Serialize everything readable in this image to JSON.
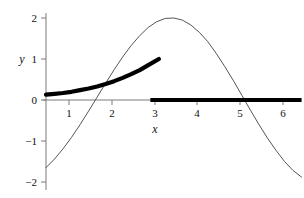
{
  "chart_data": {
    "type": "line",
    "title": "",
    "subtitle": "",
    "xlabel": "x",
    "ylabel": "y",
    "xlim": [
      0,
      6.1
    ],
    "ylim": [
      -2.1,
      2.1
    ],
    "xticks": [
      1,
      2,
      3,
      4,
      5,
      6
    ],
    "xtick_labels": [
      "1",
      "2",
      "3",
      "4",
      "5",
      "6"
    ],
    "yticks": [
      2,
      1,
      0,
      -1,
      -2
    ],
    "ytick_labels": [
      "2",
      "1",
      "0",
      "−1",
      "−2"
    ],
    "grid": false,
    "legend": null,
    "legend_position": "none",
    "series": [
      {
        "name": "sinusoid",
        "style": "thin-line",
        "color": "#555555",
        "linewidth": 1,
        "x": [
          0.0,
          0.2,
          0.4,
          0.6,
          0.8,
          1.0,
          1.2,
          1.4,
          1.6,
          1.8,
          2.0,
          2.2,
          2.4,
          2.6,
          2.8,
          3.0,
          3.2,
          3.4,
          3.6,
          3.8,
          4.0,
          4.2,
          4.4,
          4.6,
          4.8,
          5.0,
          5.2,
          5.4,
          5.6,
          5.8,
          6.0
        ],
        "values": [
          -1.65,
          -1.44,
          -1.19,
          -0.91,
          -0.6,
          -0.27,
          0.07,
          0.41,
          0.74,
          1.05,
          1.33,
          1.57,
          1.77,
          1.91,
          1.99,
          2.0,
          1.95,
          1.83,
          1.65,
          1.42,
          1.13,
          0.81,
          0.47,
          0.11,
          -0.25,
          -0.6,
          -0.93,
          -1.23,
          -1.5,
          -1.72,
          -1.88
        ]
      },
      {
        "name": "exponential-growth",
        "style": "thick-line",
        "color": "#000000",
        "linewidth": 4.2,
        "x": [
          0.0,
          0.2,
          0.4,
          0.6,
          0.8,
          1.0,
          1.2,
          1.4,
          1.6,
          1.8,
          2.0,
          2.2,
          2.4,
          2.65
        ],
        "values": [
          0.13,
          0.15,
          0.17,
          0.2,
          0.24,
          0.28,
          0.33,
          0.39,
          0.46,
          0.54,
          0.63,
          0.73,
          0.85,
          1.0
        ]
      },
      {
        "name": "zero-segment",
        "style": "thick-segment",
        "color": "#000000",
        "linewidth": 4.2,
        "x": [
          2.45,
          6.0
        ],
        "values": [
          0.0,
          0.0
        ]
      }
    ],
    "annotations": []
  },
  "axis": {
    "y_label": "y",
    "x_label": "x"
  }
}
